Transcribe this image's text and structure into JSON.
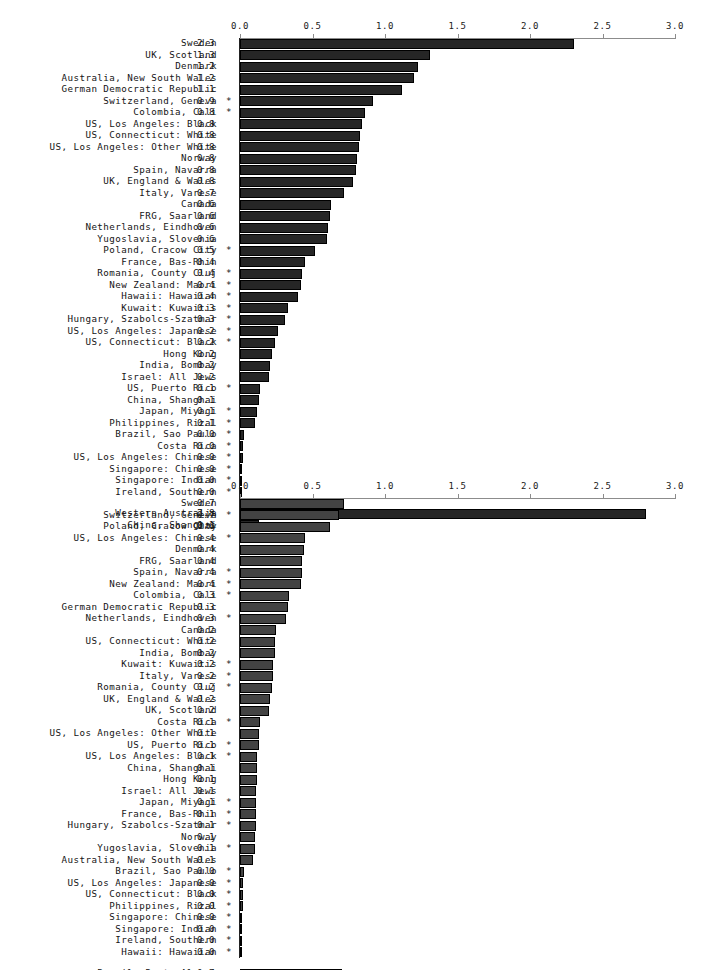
{
  "figure": {
    "type": "grouped-horizontal-bar-panels",
    "panels": 2,
    "note_symbol": "*"
  },
  "axis": {
    "ticks": [
      "0.0",
      "0.5",
      "1.0",
      "1.5",
      "2.0",
      "2.5",
      "3.0"
    ],
    "tick_values": [
      0.0,
      0.5,
      1.0,
      1.5,
      2.0,
      2.5,
      3.0
    ],
    "min": 0.0,
    "max": 3.0,
    "axis_color": "#8c8c8c"
  },
  "chart_data": [
    {
      "type": "bar",
      "orientation": "horizontal",
      "title": "",
      "xlabel": "",
      "ylabel": "",
      "xlim": [
        0.0,
        3.0
      ],
      "grid": false,
      "legend": "none",
      "bar_color": "#262626",
      "categories": [
        "Sweden",
        "UK, Scotland",
        "Denmark",
        "Australia, New South Wales",
        "German Democratic Republic",
        "Switzerland, Geneva",
        "Colombia, Cali",
        "US, Los Angeles: Black",
        "US, Connecticut: White",
        "US, Los Angeles: Other White",
        "Norway",
        "Spain, Navarra",
        "UK, England & Wales",
        "Italy, Varese",
        "Canada",
        "FRG, Saarland",
        "Netherlands, Eindhoven",
        "Yugoslavia, Slovenia",
        "Poland, Cracow City",
        "France, Bas-Rhin",
        "Romania, County Cluj",
        "New Zealand: Maori",
        "Hawaii: Hawaiian",
        "Kuwait: Kuwaitis",
        "Hungary, Szabolcs-Szatmar",
        "US, Los Angeles: Japanese",
        "US, Connecticut: Black",
        "Hong Kong",
        "India, Bombay",
        "Israel: All Jews",
        "US, Puerto Rico",
        "China, Shanghai",
        "Japan, Miyagi",
        "Philippines, Rizal",
        "Brazil, Sao Paulo",
        "Costa Rica",
        "US, Los Angeles: Chinese",
        "Singapore: Chinese",
        "Singapore: Indian",
        "Ireland, Southern"
      ],
      "values": [
        2.3,
        1.3,
        1.2,
        1.2,
        1.1,
        0.9,
        0.8,
        0.8,
        0.8,
        0.8,
        0.8,
        0.8,
        0.8,
        0.7,
        0.6,
        0.6,
        0.6,
        0.6,
        0.5,
        0.4,
        0.4,
        0.4,
        0.4,
        0.3,
        0.3,
        0.2,
        0.2,
        0.2,
        0.2,
        0.2,
        0.1,
        0.1,
        0.1,
        0.1,
        0.0,
        0.0,
        0.0,
        0.0,
        0.0,
        0.0
      ],
      "value_labels": [
        "2.3",
        "1.3",
        "1.2",
        "1.2",
        "1.1",
        "0.9",
        "0.8",
        "0.8",
        "0.8",
        "0.8",
        "0.8",
        "0.8",
        "0.8",
        "0.7",
        "0.6",
        "0.6",
        "0.6",
        "0.6",
        "0.5",
        "0.4",
        "0.4",
        "0.4",
        "0.4",
        "0.3",
        "0.3",
        "0.2",
        "0.2",
        "0.2",
        "0.2",
        "0.2",
        "0.1",
        "0.1",
        "0.1",
        "0.1",
        "0.0",
        "0.0",
        "0.0",
        "0.0",
        "0.0",
        "0.0"
      ],
      "starred": [
        false,
        false,
        false,
        false,
        false,
        true,
        true,
        false,
        false,
        false,
        false,
        false,
        false,
        false,
        false,
        false,
        false,
        false,
        true,
        false,
        true,
        true,
        true,
        true,
        true,
        true,
        true,
        false,
        false,
        false,
        true,
        false,
        true,
        true,
        true,
        true,
        true,
        true,
        true,
        true
      ],
      "bar_lengths": [
        2.3,
        1.31,
        1.23,
        1.2,
        1.12,
        0.92,
        0.86,
        0.84,
        0.83,
        0.82,
        0.81,
        0.8,
        0.78,
        0.72,
        0.63,
        0.62,
        0.61,
        0.6,
        0.52,
        0.45,
        0.43,
        0.42,
        0.4,
        0.33,
        0.31,
        0.26,
        0.24,
        0.22,
        0.21,
        0.2,
        0.14,
        0.13,
        0.12,
        0.1,
        0.03,
        0.02,
        0.02,
        0.01,
        0.01,
        0.01
      ],
      "extra_group": {
        "categories": [
          "Western Australia",
          "China, Shanghai"
        ],
        "values": [
          2.8,
          0.1
        ],
        "value_labels": [
          "2.8",
          "0.1"
        ],
        "starred": [
          false,
          false
        ],
        "bar_lengths": [
          2.8,
          0.13
        ]
      }
    },
    {
      "type": "bar",
      "orientation": "horizontal",
      "title": "",
      "xlabel": "",
      "ylabel": "",
      "xlim": [
        0.0,
        3.0
      ],
      "grid": false,
      "legend": "none",
      "bar_color": "#434343",
      "categories": [
        "Sweden",
        "Switzerland, Geneva",
        "Poland, Cracow City",
        "US, Los Angeles: Chinese",
        "Denmark",
        "FRG, Saarland",
        "Spain, Navarra",
        "New Zealand: Maori",
        "Colombia, Cali",
        "German Democratic Republic",
        "Netherlands, Eindhoven",
        "Canada",
        "US, Connecticut: White",
        "India, Bombay",
        "Kuwait: Kuwaitis",
        "Italy, Varese",
        "Romania, County Cluj",
        "UK, England & Wales",
        "UK, Scotland",
        "Costa Rica",
        "US, Los Angeles: Other White",
        "US, Puerto Rico",
        "US, Los Angeles: Black",
        "China, Shanghai",
        "Hong Kong",
        "Israel: All Jews",
        "Japan, Miyagi",
        "France, Bas-Rhin",
        "Hungary, Szabolcs-Szatmar",
        "Norway",
        "Yugoslavia, Slovenia",
        "Australia, New South Wales",
        "Brazil, Sao Paulo",
        "US, Los Angeles: Japanese",
        "US, Connecticut: Black",
        "Philippines, Rizal",
        "Singapore: Chinese",
        "Singapore: Indian",
        "Ireland, Southern",
        "Hawaii: Hawaiian"
      ],
      "values": [
        0.7,
        0.7,
        0.6,
        0.4,
        0.4,
        0.4,
        0.4,
        0.4,
        0.3,
        0.3,
        0.3,
        0.2,
        0.2,
        0.2,
        0.2,
        0.2,
        0.2,
        0.2,
        0.2,
        0.1,
        0.1,
        0.1,
        0.1,
        0.1,
        0.1,
        0.1,
        0.1,
        0.1,
        0.1,
        0.1,
        0.1,
        0.1,
        0.0,
        0.0,
        0.0,
        0.0,
        0.0,
        0.0,
        0.0,
        0.0
      ],
      "value_labels": [
        "0.7",
        "0.7",
        "0.6",
        "0.4",
        "0.4",
        "0.4",
        "0.4",
        "0.4",
        "0.3",
        "0.3",
        "0.3",
        "0.2",
        "0.2",
        "0.2",
        "0.2",
        "0.2",
        "0.2",
        "0.2",
        "0.2",
        "0.1",
        "0.1",
        "0.1",
        "0.1",
        "0.1",
        "0.1",
        "0.1",
        "0.1",
        "0.1",
        "0.1",
        "0.1",
        "0.1",
        "0.1",
        "0.0",
        "0.0",
        "0.0",
        "0.0",
        "0.0",
        "0.0",
        "0.0",
        "0.0"
      ],
      "starred": [
        false,
        true,
        false,
        true,
        false,
        false,
        true,
        true,
        true,
        false,
        true,
        false,
        false,
        false,
        true,
        true,
        true,
        false,
        false,
        true,
        false,
        true,
        true,
        false,
        false,
        false,
        true,
        true,
        true,
        false,
        true,
        false,
        true,
        true,
        true,
        true,
        true,
        true,
        true,
        true
      ],
      "bar_lengths": [
        0.72,
        0.68,
        0.62,
        0.45,
        0.44,
        0.43,
        0.43,
        0.42,
        0.34,
        0.33,
        0.32,
        0.25,
        0.24,
        0.24,
        0.23,
        0.23,
        0.22,
        0.21,
        0.2,
        0.14,
        0.13,
        0.13,
        0.12,
        0.12,
        0.12,
        0.11,
        0.11,
        0.11,
        0.11,
        0.1,
        0.1,
        0.09,
        0.03,
        0.02,
        0.02,
        0.02,
        0.01,
        0.01,
        0.01,
        0.01
      ],
      "extra_group": {
        "categories": [
          "Brazil, Porto Alegre",
          "Norway"
        ],
        "values": [
          0.7,
          0.1
        ],
        "value_labels": [
          "0.7",
          "0.1"
        ],
        "starred": [
          false,
          false
        ],
        "bar_lengths": [
          0.7,
          0.12
        ]
      }
    }
  ]
}
